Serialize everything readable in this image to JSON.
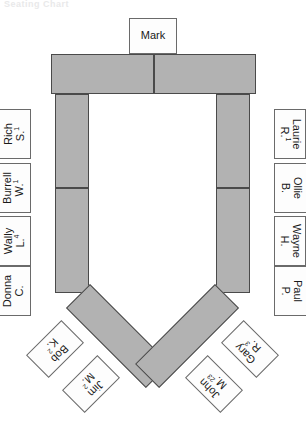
{
  "header": {
    "faint_text": "Seating Chart"
  },
  "colors": {
    "table_fill": "#b2b2b2",
    "table_stroke": "#4a4a4a",
    "card_fill": "#fdfdfd",
    "card_stroke": "#6a6a6a",
    "page_background": "#ffffff",
    "text": "#1a1a1a"
  },
  "diagram": {
    "type": "seating-chart",
    "shape": "u-shaped-table-with-angled-wings",
    "table_segments": [
      {
        "id": "top-left",
        "orientation": "horizontal"
      },
      {
        "id": "top-right",
        "orientation": "horizontal"
      },
      {
        "id": "left-upper",
        "orientation": "vertical"
      },
      {
        "id": "left-lower",
        "orientation": "vertical"
      },
      {
        "id": "right-upper",
        "orientation": "vertical"
      },
      {
        "id": "right-lower",
        "orientation": "vertical"
      },
      {
        "id": "wing-left",
        "orientation": "diagonal-135"
      },
      {
        "id": "wing-right",
        "orientation": "diagonal-45"
      }
    ]
  },
  "seats": {
    "head": [
      {
        "id": "mark",
        "first": "Mark",
        "last": "",
        "sup": "",
        "position": "head-of-table",
        "orientation": "upright"
      }
    ],
    "left_side": [
      {
        "id": "rich",
        "first": "Rich",
        "last": "S.",
        "sup": "1",
        "position": "left-1",
        "orientation": "rotated-ccw"
      },
      {
        "id": "burrell",
        "first": "Burrell",
        "last": "W.",
        "sup": "1",
        "position": "left-2",
        "orientation": "rotated-ccw"
      },
      {
        "id": "wally",
        "first": "Wally",
        "last": "L.",
        "sup": "4",
        "position": "left-3",
        "orientation": "rotated-ccw"
      },
      {
        "id": "donna",
        "first": "Donna",
        "last": "C.",
        "sup": "",
        "position": "left-4",
        "orientation": "rotated-ccw"
      }
    ],
    "right_side": [
      {
        "id": "laurie",
        "first": "Laurie",
        "last": "R.",
        "sup": "1",
        "position": "right-1",
        "orientation": "rotated-cw"
      },
      {
        "id": "ollie",
        "first": "Ollie",
        "last": "B.",
        "sup": "",
        "position": "right-2",
        "orientation": "rotated-cw"
      },
      {
        "id": "wayne",
        "first": "Wayne",
        "last": "H.",
        "sup": "",
        "position": "right-3",
        "orientation": "rotated-cw"
      },
      {
        "id": "paul",
        "first": "Paul",
        "last": "P.",
        "sup": "",
        "position": "right-4",
        "orientation": "rotated-cw"
      }
    ],
    "left_wing": [
      {
        "id": "bob",
        "first": "Bob",
        "last": "K.",
        "sup": "2",
        "position": "left-wing-outer",
        "orientation": "rotated-135"
      },
      {
        "id": "jim",
        "first": "Jim",
        "last": "M.",
        "sup": "2",
        "position": "left-wing-inner",
        "orientation": "rotated-135"
      }
    ],
    "right_wing": [
      {
        "id": "gary",
        "first": "Gary",
        "last": "R.",
        "sup": "3",
        "position": "right-wing-outer",
        "orientation": "rotated-neg135"
      },
      {
        "id": "john",
        "first": "John",
        "last": "M.",
        "sup": "23",
        "position": "right-wing-inner",
        "orientation": "rotated-neg135"
      }
    ]
  }
}
